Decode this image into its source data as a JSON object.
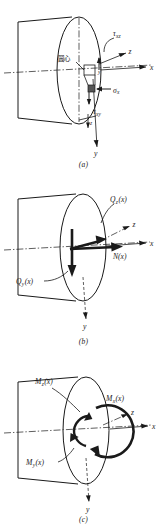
{
  "figure": {
    "panels": [
      {
        "id": "a",
        "caption": "(a)",
        "description": "Stress components on an element at the cross-section",
        "center_label": "圆心",
        "labels": [
          {
            "name": "tau-xz",
            "base": "τ",
            "sub": "xz"
          },
          {
            "name": "tau-xy",
            "base": "τ",
            "sub": "xy"
          },
          {
            "name": "sigma-x",
            "base": "σ",
            "sub": "x"
          }
        ],
        "axes": [
          {
            "name": "x",
            "label": "x"
          },
          {
            "name": "y",
            "label": "y"
          },
          {
            "name": "z",
            "label": "z"
          }
        ]
      },
      {
        "id": "b",
        "caption": "(b)",
        "description": "Internal force resultants on the cross-section",
        "labels": [
          {
            "name": "shear-force-z",
            "base": "Q",
            "sub": "z",
            "arg": "(x)"
          },
          {
            "name": "shear-force-y",
            "base": "Q",
            "sub": "y",
            "arg": "(x)"
          },
          {
            "name": "normal-force",
            "base": "N",
            "sub": "",
            "arg": "(x)"
          }
        ],
        "axes": [
          {
            "name": "x",
            "label": "x"
          },
          {
            "name": "y",
            "label": "y"
          },
          {
            "name": "z",
            "label": "z"
          }
        ]
      },
      {
        "id": "c",
        "caption": "(c)",
        "description": "Internal moment resultants on the cross-section",
        "labels": [
          {
            "name": "bending-moment-z",
            "base": "M",
            "sub": "z",
            "arg": "(x)"
          },
          {
            "name": "torsional-moment-x",
            "base": "M",
            "sub": "x",
            "arg": "(x)"
          },
          {
            "name": "bending-moment-y",
            "base": "M",
            "sub": "y",
            "arg": "(x)"
          }
        ],
        "axes": [
          {
            "name": "x",
            "label": "x"
          },
          {
            "name": "y",
            "label": "y"
          },
          {
            "name": "z",
            "label": "z"
          }
        ]
      }
    ],
    "colors": {
      "ink": "#1a1a1a",
      "background": "#ffffff"
    }
  }
}
